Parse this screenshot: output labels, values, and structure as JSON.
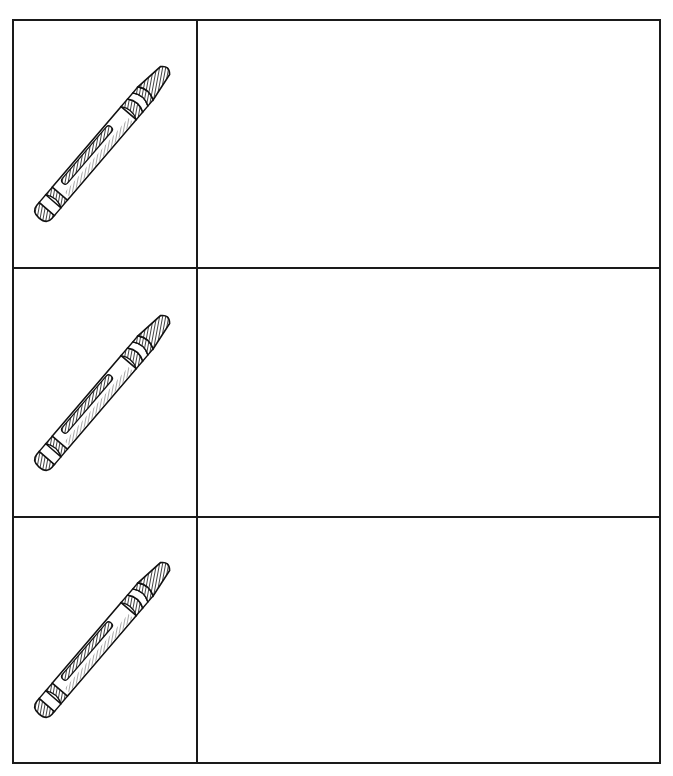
{
  "worksheet": {
    "layout": "3 rows x 2 columns table",
    "rows": [
      {
        "icon": "crayon-icon",
        "answer": ""
      },
      {
        "icon": "crayon-icon",
        "answer": ""
      },
      {
        "icon": "crayon-icon",
        "answer": ""
      }
    ],
    "colors": {
      "line": "#1a1a1a",
      "background": "#ffffff"
    }
  }
}
